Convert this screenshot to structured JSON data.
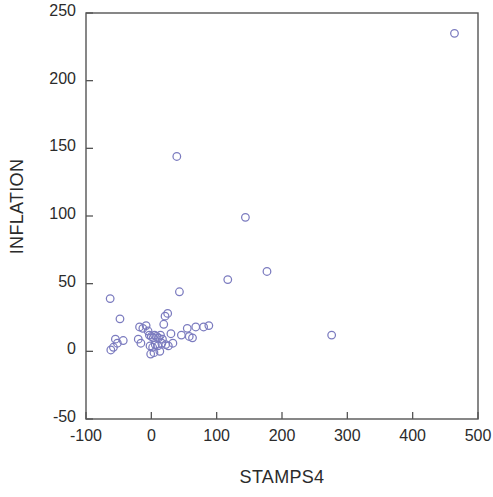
{
  "chart_data": {
    "type": "scatter",
    "title": "",
    "xlabel": "STAMPS4",
    "ylabel": "INFLATION",
    "xlim": [
      -100,
      500
    ],
    "ylim": [
      -50,
      250
    ],
    "xticks": [
      -100,
      0,
      100,
      200,
      300,
      400,
      500
    ],
    "yticks": [
      -50,
      0,
      50,
      100,
      150,
      200,
      250
    ],
    "xtick_labels": [
      "-100",
      "0",
      "100",
      "200",
      "300",
      "400",
      "500"
    ],
    "ytick_labels": [
      "-50",
      "0",
      "50",
      "100",
      "150",
      "200",
      "250"
    ],
    "grid": false,
    "legend": null,
    "marker": {
      "shape": "circle-open",
      "color": "#7b7bbf",
      "size": 5
    },
    "frame_color": "#555555",
    "points": [
      {
        "x": 464,
        "y": 235
      },
      {
        "x": 39,
        "y": 144
      },
      {
        "x": 144,
        "y": 99
      },
      {
        "x": 177,
        "y": 59
      },
      {
        "x": 117,
        "y": 53
      },
      {
        "x": 43,
        "y": 44
      },
      {
        "x": -63,
        "y": 39
      },
      {
        "x": -48,
        "y": 24
      },
      {
        "x": 21,
        "y": 26
      },
      {
        "x": 25,
        "y": 28
      },
      {
        "x": -18,
        "y": 18
      },
      {
        "x": -13,
        "y": 17
      },
      {
        "x": -8,
        "y": 19
      },
      {
        "x": -5,
        "y": 15
      },
      {
        "x": 19,
        "y": 20
      },
      {
        "x": 55,
        "y": 17
      },
      {
        "x": 68,
        "y": 18
      },
      {
        "x": 80,
        "y": 18
      },
      {
        "x": 88,
        "y": 19
      },
      {
        "x": -55,
        "y": 9
      },
      {
        "x": -52,
        "y": 6
      },
      {
        "x": -43,
        "y": 8
      },
      {
        "x": -20,
        "y": 9
      },
      {
        "x": -16,
        "y": 6
      },
      {
        "x": -3,
        "y": 12
      },
      {
        "x": 0,
        "y": 11
      },
      {
        "x": 3,
        "y": 10
      },
      {
        "x": 5,
        "y": 12
      },
      {
        "x": 8,
        "y": 11
      },
      {
        "x": 11,
        "y": 10
      },
      {
        "x": 14,
        "y": 12
      },
      {
        "x": 17,
        "y": 9
      },
      {
        "x": 30,
        "y": 13
      },
      {
        "x": 46,
        "y": 12
      },
      {
        "x": 58,
        "y": 11
      },
      {
        "x": 63,
        "y": 10
      },
      {
        "x": 276,
        "y": 12
      },
      {
        "x": -62,
        "y": 1
      },
      {
        "x": -58,
        "y": 3
      },
      {
        "x": -2,
        "y": 4
      },
      {
        "x": 2,
        "y": 3
      },
      {
        "x": 6,
        "y": 5
      },
      {
        "x": 10,
        "y": 4
      },
      {
        "x": 16,
        "y": 6
      },
      {
        "x": 22,
        "y": 5
      },
      {
        "x": 26,
        "y": 4
      },
      {
        "x": 33,
        "y": 6
      },
      {
        "x": -1,
        "y": -2
      },
      {
        "x": 4,
        "y": -1
      },
      {
        "x": 13,
        "y": 0
      }
    ]
  },
  "axes": {
    "x_pixel_min": 86,
    "x_pixel_max": 478,
    "y_pixel_min": 13,
    "y_pixel_max": 419
  }
}
